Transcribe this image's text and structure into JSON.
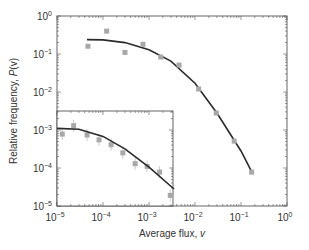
{
  "chart_data": [
    {
      "type": "scatter",
      "name": "main",
      "title": "",
      "xlabel": "Average flux, v",
      "ylabel": "Relative frequency, P(v)",
      "xscale": "log",
      "yscale": "log",
      "xlim": [
        1e-05,
        1
      ],
      "ylim": [
        1e-05,
        1
      ],
      "x_ticks": [
        "10^-5",
        "10^-4",
        "10^-3",
        "10^-2",
        "10^-1",
        "10^0"
      ],
      "y_ticks": [
        "10^0",
        "10^-1",
        "10^-2",
        "10^-3",
        "10^-4",
        "10^-5"
      ],
      "grid": false,
      "series": [
        {
          "name": "data",
          "style": "gray squares",
          "x": [
            4.7e-05,
            0.00012,
            0.0003,
            0.00074,
            0.0018,
            0.0045,
            0.012,
            0.029,
            0.071,
            0.17
          ],
          "y": [
            0.16,
            0.4,
            0.11,
            0.18,
            0.083,
            0.051,
            0.012,
            0.0028,
            0.00051,
            7.8e-05
          ]
        },
        {
          "name": "fit",
          "style": "black line",
          "x": [
            4.5e-05,
            0.0001,
            0.0003,
            0.001,
            0.003,
            0.01,
            0.03,
            0.1,
            0.17
          ],
          "y": [
            0.24,
            0.235,
            0.2,
            0.13,
            0.065,
            0.017,
            0.0028,
            0.00028,
            8e-05
          ]
        }
      ]
    },
    {
      "type": "scatter",
      "name": "inset",
      "title": "",
      "xscale": "log",
      "yscale": "log",
      "xlim": [
        1e-05,
        0.0035
      ],
      "ylim": [
        1e-05,
        0.003
      ],
      "series": [
        {
          "name": "data",
          "style": "gray squares with error bars",
          "x": [
            1.3e-05,
            2.3e-05,
            4.5e-05,
            8.2e-05,
            0.00015,
            0.00027,
            0.0005,
            0.00091,
            0.0017,
            0.0029
          ],
          "y": [
            0.00078,
            0.0013,
            0.00074,
            0.00055,
            0.00041,
            0.00025,
            0.00013,
            0.00011,
            7.8e-05,
            1.9e-05
          ]
        },
        {
          "name": "fit",
          "style": "black line",
          "x": [
            1e-05,
            3e-05,
            0.0001,
            0.0003,
            0.001,
            0.0035
          ],
          "y": [
            0.0011,
            0.00105,
            0.00068,
            0.00032,
            0.000105,
            2.8e-05
          ]
        }
      ]
    }
  ],
  "labels": {
    "xlabel_text": "Average flux, ",
    "xlabel_var": "v",
    "ylabel_text": "Relative frequency, ",
    "ylabel_var": "P",
    "ylabel_paren": "(v)"
  },
  "colors": {
    "marker": "#a8a8a8",
    "fit": "#2a2a2a",
    "frame": "#555555"
  }
}
